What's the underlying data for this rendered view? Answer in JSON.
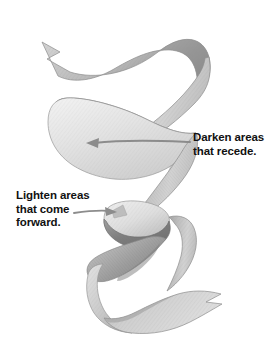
{
  "artwork": {
    "title": "Spiral ribbon shading demonstration",
    "medium": "graphite pencil drawing",
    "background_color": "#ffffff",
    "ribbon": {
      "name": "coiled-ribbon",
      "swallowtail_ends": 2,
      "tone_light": "#e9e9e9",
      "tone_mid": "#c4c4c4",
      "tone_dark": "#8d8d8d",
      "tone_darkest": "#6f6f6f",
      "outline_color": "#8a8a8a"
    }
  },
  "annotations": [
    {
      "id": "darken",
      "text": "Darken areas\nthat recede.",
      "line_1": "Darken areas",
      "line_2": "that recede.",
      "color": "#111111",
      "leader": {
        "name": "darken-leader-arrow",
        "arrowhead": "left",
        "color": "#8c8c8c"
      }
    },
    {
      "id": "lighten",
      "text": "Lighten areas\nthat come\nforward.",
      "line_1": "Lighten areas",
      "line_2": "that come",
      "line_3": "forward.",
      "color": "#111111",
      "leader": {
        "name": "lighten-leader-arrow",
        "arrowhead": "right",
        "color": "#8c8c8c"
      }
    }
  ]
}
